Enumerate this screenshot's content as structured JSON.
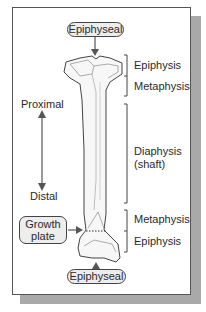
{
  "diagram": {
    "top_callout": "Epiphyseal",
    "bottom_callout": "Epiphyseal",
    "growth_plate_label": [
      "Growth",
      "plate"
    ],
    "direction": {
      "top": "Proximal",
      "bottom": "Distal"
    },
    "regions": [
      {
        "label": "Epiphysis",
        "position": "proximal"
      },
      {
        "label": "Metaphysis",
        "position": "proximal"
      },
      {
        "label": "Diaphysis",
        "sublabel": "(shaft)",
        "position": "middle"
      },
      {
        "label": "Metaphysis",
        "position": "distal"
      },
      {
        "label": "Epiphysis",
        "position": "distal"
      }
    ]
  }
}
